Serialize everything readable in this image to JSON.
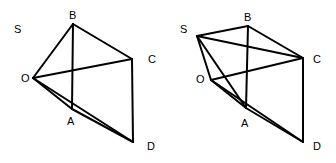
{
  "figures": [
    {
      "name": "left",
      "vertices": {
        "B": [
          73,
          24
        ],
        "C": [
          132,
          59
        ],
        "O": [
          33,
          78
        ],
        "A": [
          72,
          109
        ],
        "D": [
          133,
          142
        ]
      },
      "labels": {
        "S": {
          "text": "S",
          "pos": [
            14,
            33
          ]
        },
        "B": {
          "text": "B",
          "pos": [
            69,
            19
          ]
        },
        "C": {
          "text": "C",
          "pos": [
            148,
            63
          ]
        },
        "O": {
          "text": "O",
          "pos": [
            21,
            82
          ]
        },
        "A": {
          "text": "A",
          "pos": [
            67,
            125
          ]
        },
        "D": {
          "text": "D",
          "pos": [
            147,
            150
          ]
        }
      },
      "edges": [
        [
          "O",
          "B"
        ],
        [
          "B",
          "C"
        ],
        [
          "O",
          "C"
        ],
        [
          "B",
          "A"
        ],
        [
          "C",
          "D"
        ],
        [
          "O",
          "A"
        ],
        [
          "A",
          "D"
        ],
        [
          "O",
          "D"
        ]
      ]
    },
    {
      "name": "right",
      "vertices": {
        "S": [
          197,
          36
        ],
        "B": [
          248,
          26
        ],
        "C": [
          303,
          58
        ],
        "O": [
          211,
          80
        ],
        "A": [
          246,
          108
        ],
        "D": [
          303,
          142
        ]
      },
      "labels": {
        "S": {
          "text": "S",
          "pos": [
            180,
            33
          ]
        },
        "B": {
          "text": "B",
          "pos": [
            244,
            21
          ]
        },
        "C": {
          "text": "C",
          "pos": [
            313,
            63
          ]
        },
        "O": {
          "text": "O",
          "pos": [
            196,
            83
          ]
        },
        "A": {
          "text": "A",
          "pos": [
            241,
            127
          ]
        },
        "D": {
          "text": "D",
          "pos": [
            313,
            150
          ]
        }
      },
      "edges": [
        [
          "S",
          "B"
        ],
        [
          "S",
          "C"
        ],
        [
          "S",
          "O"
        ],
        [
          "S",
          "A"
        ],
        [
          "B",
          "C"
        ],
        [
          "O",
          "C"
        ],
        [
          "B",
          "A"
        ],
        [
          "C",
          "D"
        ],
        [
          "O",
          "A"
        ],
        [
          "A",
          "D"
        ],
        [
          "O",
          "D"
        ]
      ]
    }
  ]
}
